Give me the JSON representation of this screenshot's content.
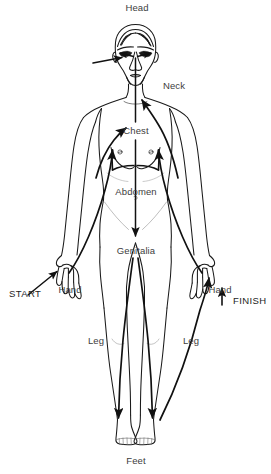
{
  "diagram": {
    "line_color": "#1a1a1a",
    "arrow_color": "#111111",
    "label_color": "#3d3d3d",
    "background": "#ffffff"
  },
  "labels": {
    "head": "Head",
    "neck": "Neck",
    "chest": "Chest",
    "abdomen": "Abdomen",
    "genitalia": "Genitalia",
    "hand_left": "Hand",
    "hand_right": "Hand",
    "leg_left": "Leg",
    "leg_right": "Leg",
    "feet": "Feet"
  },
  "markers": {
    "start": "START",
    "finish": "FINISH"
  },
  "regions": [
    {
      "id": "head",
      "label": "Head",
      "x": 137,
      "y": 8
    },
    {
      "id": "neck",
      "label": "Neck",
      "x": 179,
      "y": 87
    },
    {
      "id": "chest",
      "label": "Chest",
      "x": 136,
      "y": 131
    },
    {
      "id": "abdomen",
      "label": "Abdomen",
      "x": 136,
      "y": 192
    },
    {
      "id": "hand-left",
      "label": "Hand",
      "x": 71,
      "y": 285
    },
    {
      "id": "genitalia",
      "label": "Genitalia",
      "x": 136,
      "y": 252
    },
    {
      "id": "hand-right",
      "label": "Hand",
      "x": 219,
      "y": 285
    },
    {
      "id": "leg-left",
      "label": "Leg",
      "x": 96,
      "y": 341
    },
    {
      "id": "leg-right",
      "label": "Leg",
      "x": 190,
      "y": 341
    },
    {
      "id": "feet",
      "label": "Feet",
      "x": 146,
      "y": 461
    }
  ],
  "path_sequence": [
    "Hand (left) — START",
    "Chest",
    "Neck",
    "Head",
    "Abdomen",
    "Genitalia",
    "Leg",
    "Feet",
    "Hand (right) — FINISH"
  ]
}
